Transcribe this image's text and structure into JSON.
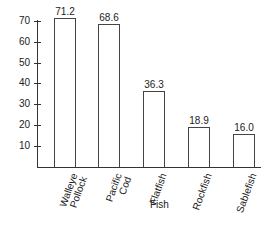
{
  "chart_data": {
    "type": "bar",
    "title": "",
    "xlabel": "Fish",
    "ylabel": "",
    "categories": [
      "Walleye Pollock",
      "Pacific Cod",
      "Flatfish",
      "Rockfish",
      "Sablefish"
    ],
    "category_display": [
      "Walleye\nPollock",
      "Pacific\nCod",
      "Flatfish",
      "Rockfish",
      "Sablefish"
    ],
    "values": [
      71.2,
      68.6,
      36.3,
      18.9,
      16.0
    ],
    "value_labels": [
      "71.2",
      "68.6",
      "36.3",
      "18.9",
      "16.0"
    ],
    "yticks": [
      "10",
      "20",
      "30",
      "40",
      "50",
      "60",
      "70"
    ],
    "ylim": [
      0,
      71
    ],
    "grid": false,
    "legend": null,
    "bar_fill": "#ffffff",
    "bar_stroke": "#444444"
  }
}
